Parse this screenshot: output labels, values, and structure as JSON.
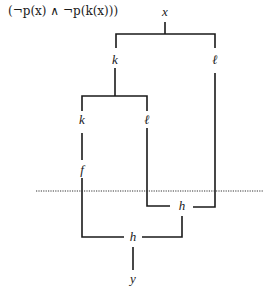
{
  "formula": "(¬p(x) ∧ ¬p(k(x)))",
  "nodes": {
    "x_top": "x",
    "k_upper": "k",
    "l_upper": "ℓ",
    "k_lower": "k",
    "l_lower": "ℓ",
    "f": "f",
    "h_upper": "h",
    "h_lower": "h",
    "y_bottom": "y"
  },
  "diagram": {
    "type": "circuit/tree composition diagram",
    "edges": [
      [
        "x",
        "k_upper"
      ],
      [
        "x",
        "l_upper"
      ],
      [
        "k_upper",
        "k_lower"
      ],
      [
        "k_upper",
        "l_lower"
      ],
      [
        "k_lower",
        "f"
      ],
      [
        "f",
        "h_lower"
      ],
      [
        "l_lower",
        "h_upper"
      ],
      [
        "l_upper",
        "h_upper"
      ],
      [
        "h_upper",
        "h_lower"
      ],
      [
        "h_lower",
        "y"
      ]
    ],
    "separator": "dotted horizontal line"
  }
}
